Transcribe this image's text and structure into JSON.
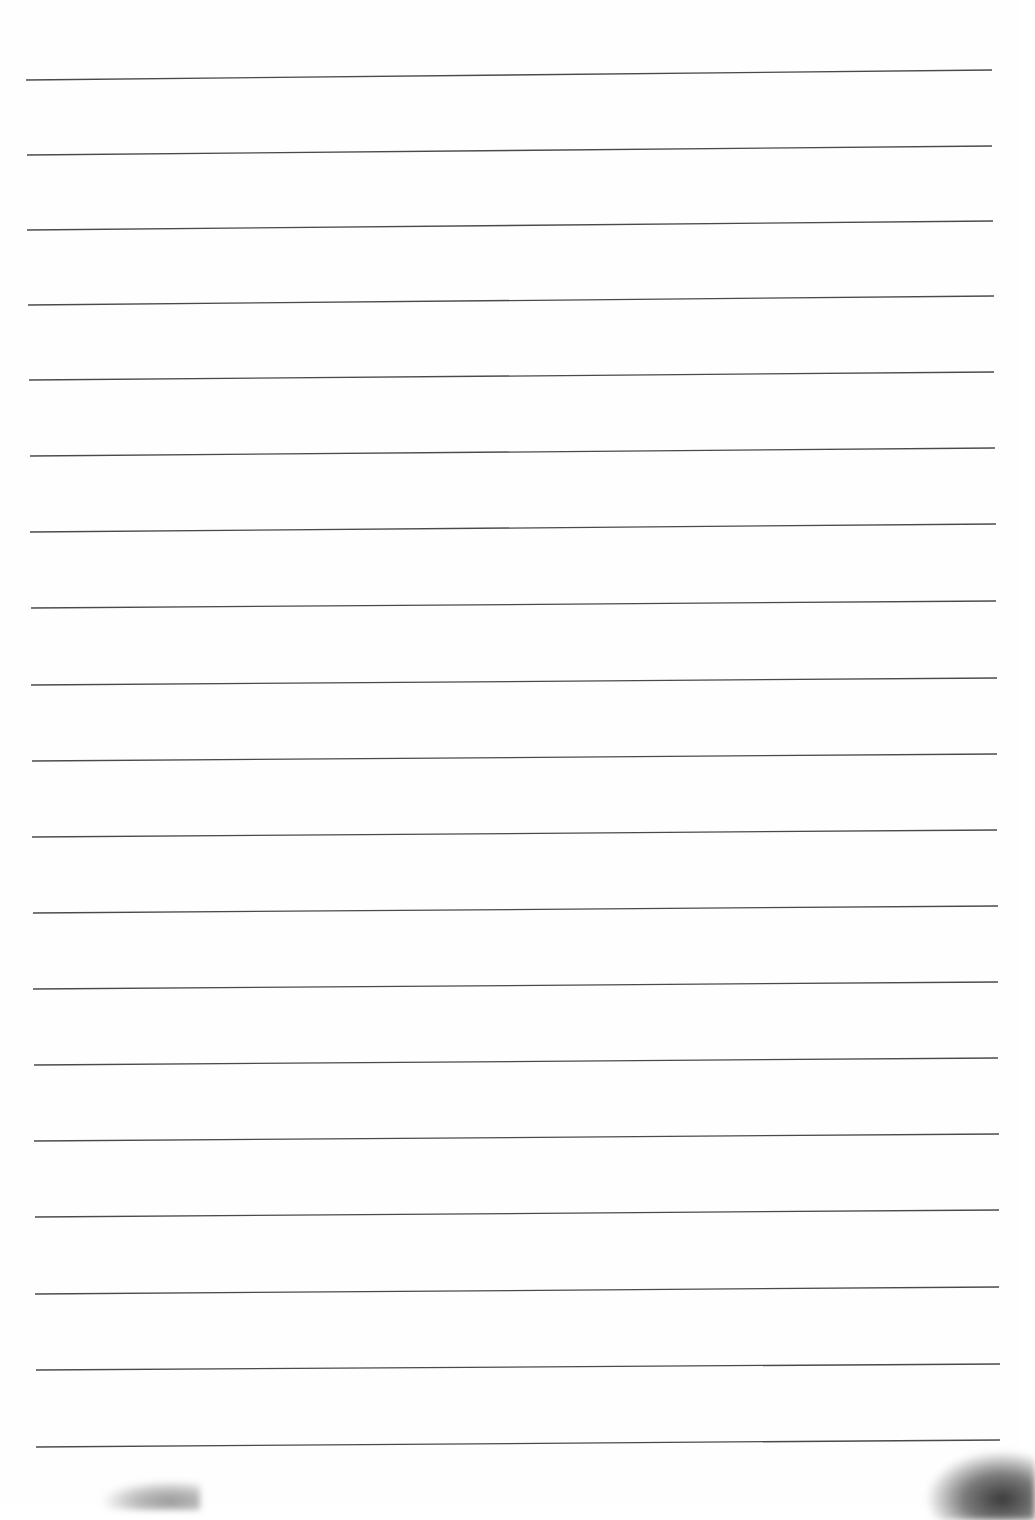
{
  "document": {
    "type": "blank-ruled-sheet",
    "paper_color": "#fefefe",
    "rule_color": "#2a2a2a",
    "rule_count": 19,
    "rules": [
      {
        "x1": 26,
        "y1": 80,
        "x2": 992,
        "y2": 70
      },
      {
        "x1": 27,
        "y1": 155,
        "x2": 992,
        "y2": 146
      },
      {
        "x1": 27,
        "y1": 230,
        "x2": 993,
        "y2": 221
      },
      {
        "x1": 28,
        "y1": 305,
        "x2": 994,
        "y2": 296
      },
      {
        "x1": 29,
        "y1": 380,
        "x2": 994,
        "y2": 372
      },
      {
        "x1": 30,
        "y1": 456,
        "x2": 995,
        "y2": 448
      },
      {
        "x1": 30,
        "y1": 532,
        "x2": 996,
        "y2": 524
      },
      {
        "x1": 31,
        "y1": 608,
        "x2": 996,
        "y2": 601
      },
      {
        "x1": 31,
        "y1": 685,
        "x2": 997,
        "y2": 678
      },
      {
        "x1": 32,
        "y1": 761,
        "x2": 997,
        "y2": 754
      },
      {
        "x1": 32,
        "y1": 837,
        "x2": 997,
        "y2": 830
      },
      {
        "x1": 33,
        "y1": 913,
        "x2": 998,
        "y2": 906
      },
      {
        "x1": 33,
        "y1": 989,
        "x2": 998,
        "y2": 982
      },
      {
        "x1": 34,
        "y1": 1065,
        "x2": 998,
        "y2": 1058
      },
      {
        "x1": 34,
        "y1": 1141,
        "x2": 999,
        "y2": 1134
      },
      {
        "x1": 35,
        "y1": 1217,
        "x2": 999,
        "y2": 1210
      },
      {
        "x1": 35,
        "y1": 1294,
        "x2": 999,
        "y2": 1287
      },
      {
        "x1": 36,
        "y1": 1370,
        "x2": 1000,
        "y2": 1364
      },
      {
        "x1": 36,
        "y1": 1447,
        "x2": 1000,
        "y2": 1440
      }
    ],
    "artifacts": [
      {
        "name": "bottom-right-smudge",
        "x": 925,
        "y": 1450,
        "w": 110,
        "h": 70,
        "color": "#3a3a3a"
      },
      {
        "name": "bottom-left-smudge",
        "x": 100,
        "y": 1480,
        "w": 100,
        "h": 30,
        "color": "#9a9a9a"
      }
    ]
  }
}
